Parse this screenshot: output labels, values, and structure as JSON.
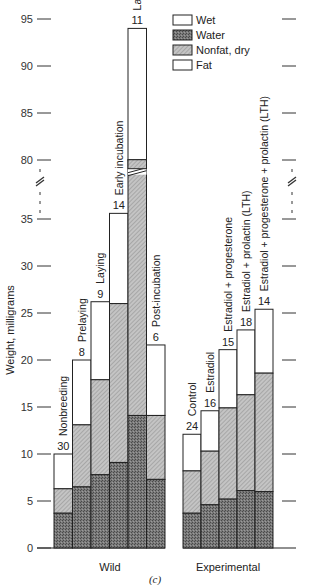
{
  "chart_data": {
    "type": "bar",
    "subtype": "stacked",
    "title": "",
    "caption": "(c)",
    "ylabel": "Weight, milligrams",
    "xlabel": "",
    "ylim": [
      0,
      95
    ],
    "axis_break": {
      "from": 36,
      "to": 79
    },
    "yticks_lower": [
      0,
      5,
      10,
      15,
      20,
      25,
      30,
      35
    ],
    "yticks_upper": [
      80,
      85,
      90,
      95
    ],
    "legend": [
      {
        "name": "Wet",
        "fill": "white"
      },
      {
        "name": "Water",
        "fill": "dark-hatch"
      },
      {
        "name": "Nonfat, dry",
        "fill": "light-hatch"
      },
      {
        "name": "Fat",
        "fill": "white"
      }
    ],
    "legend_position": "upper-right",
    "stack_layers": [
      "Nonfat, dry (bottom)",
      "Water (middle)",
      "Fat / Wet (top)"
    ],
    "groups": [
      {
        "name": "Wild",
        "categories": [
          "Nonbreeding",
          "Prelaying",
          "Laying",
          "Early incubation",
          "Late incubation",
          "Post-incubation"
        ],
        "n": [
          30,
          8,
          9,
          14,
          11,
          6
        ],
        "bottom": [
          3.7,
          6.5,
          7.8,
          9.1,
          14.1,
          7.3
        ],
        "middle_top": [
          6.3,
          13.1,
          17.9,
          26.0,
          80.0,
          14.1
        ],
        "total": [
          10.0,
          20.0,
          26.2,
          35.6,
          94.0,
          21.6
        ]
      },
      {
        "name": "Experimental",
        "categories": [
          "Control",
          "Estradiol",
          "Estradiol + progesterone",
          "Estradiol + prolactin (LTH)",
          "Estradiol + progesterone + prolactin (LTH)"
        ],
        "n": [
          24,
          16,
          15,
          18,
          14
        ],
        "bottom": [
          3.7,
          4.6,
          5.2,
          6.1,
          6.0
        ],
        "middle_top": [
          8.2,
          10.3,
          14.9,
          16.3,
          18.6
        ],
        "total": [
          12.1,
          14.6,
          21.1,
          23.2,
          25.4
        ]
      }
    ]
  },
  "colors": {
    "dark_fill": "#6e6e6e",
    "light_fill": "#b4b4b4",
    "top_fill": "#ffffff",
    "stroke": "#222222"
  }
}
